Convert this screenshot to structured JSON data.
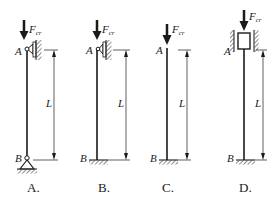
{
  "figure": {
    "panels": [
      {
        "caption": "A.",
        "top_label": "A",
        "bottom_label": "B",
        "force_label": "F",
        "force_sub": "cr",
        "length_label": "L",
        "top_support": "guided-pin (roller against wall)",
        "bottom_support": "pin"
      },
      {
        "caption": "B.",
        "top_label": "A",
        "bottom_label": "B",
        "force_label": "F",
        "force_sub": "cr",
        "length_label": "L",
        "top_support": "guided-pin (roller against wall)",
        "bottom_support": "fixed"
      },
      {
        "caption": "C.",
        "top_label": "A",
        "bottom_label": "B",
        "force_label": "F",
        "force_sub": "cr",
        "length_label": "L",
        "top_support": "free",
        "bottom_support": "fixed"
      },
      {
        "caption": "D.",
        "top_label": "A",
        "bottom_label": "B",
        "force_label": "F",
        "force_sub": "cr",
        "length_label": "L",
        "top_support": "sliding block between walls",
        "bottom_support": "fixed"
      }
    ]
  },
  "colors": {
    "ink": "#1a1a1a",
    "background": "#ffffff"
  }
}
